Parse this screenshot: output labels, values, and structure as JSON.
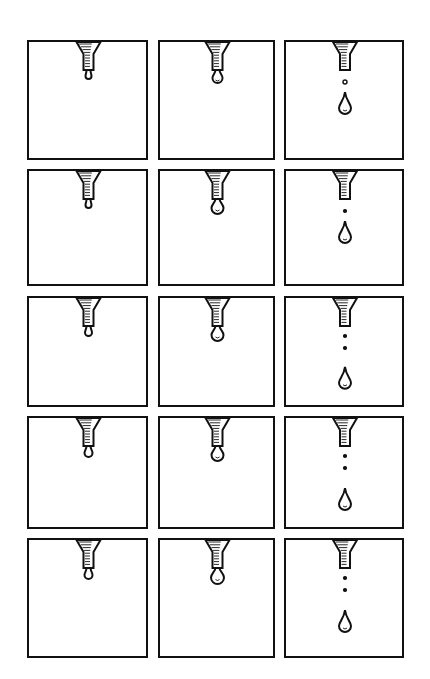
{
  "colors": {
    "ink": "#111111",
    "paper": "#ffffff"
  },
  "grid": {
    "rows": 5,
    "cols": 3
  },
  "columns": [
    {
      "x": 27,
      "w": 121
    },
    {
      "x": 158,
      "w": 117
    },
    {
      "x": 284,
      "w": 120
    }
  ],
  "rows": [
    {
      "y": 40,
      "h": 120
    },
    {
      "y": 169,
      "h": 117
    },
    {
      "y": 296,
      "h": 111
    },
    {
      "y": 416,
      "h": 113
    },
    {
      "y": 538,
      "h": 120
    }
  ],
  "panels": [
    {
      "row": 0,
      "col": 0,
      "stage": "small-drop-forming",
      "drop_r": 3,
      "dots": 0,
      "fall": false
    },
    {
      "row": 0,
      "col": 1,
      "stage": "drop-growing",
      "drop_r": 5,
      "dots": 0,
      "fall": false
    },
    {
      "row": 0,
      "col": 2,
      "stage": "drop-falling",
      "drop_r": 0,
      "dots": 1,
      "fall": true
    },
    {
      "row": 1,
      "col": 0,
      "stage": "small-drop-forming",
      "drop_r": 3,
      "dots": 0,
      "fall": false
    },
    {
      "row": 1,
      "col": 1,
      "stage": "drop-growing",
      "drop_r": 6,
      "dots": 0,
      "fall": false
    },
    {
      "row": 1,
      "col": 2,
      "stage": "drop-falling",
      "drop_r": 0,
      "dots": 1,
      "fall": true
    },
    {
      "row": 2,
      "col": 0,
      "stage": "small-drop-forming",
      "drop_r": 3.5,
      "dots": 0,
      "fall": false
    },
    {
      "row": 2,
      "col": 1,
      "stage": "drop-growing",
      "drop_r": 6,
      "dots": 0,
      "fall": false
    },
    {
      "row": 2,
      "col": 2,
      "stage": "drop-falling",
      "drop_r": 0,
      "dots": 2,
      "fall": true
    },
    {
      "row": 3,
      "col": 0,
      "stage": "small-drop-forming",
      "drop_r": 4,
      "dots": 0,
      "fall": false
    },
    {
      "row": 3,
      "col": 1,
      "stage": "drop-growing",
      "drop_r": 6,
      "dots": 0,
      "fall": false
    },
    {
      "row": 3,
      "col": 2,
      "stage": "drop-falling",
      "drop_r": 0,
      "dots": 2,
      "fall": true
    },
    {
      "row": 4,
      "col": 0,
      "stage": "small-drop-forming",
      "drop_r": 4,
      "dots": 0,
      "fall": false
    },
    {
      "row": 4,
      "col": 1,
      "stage": "drop-growing",
      "drop_r": 6.5,
      "dots": 0,
      "fall": false
    },
    {
      "row": 4,
      "col": 2,
      "stage": "drop-falling",
      "drop_r": 0,
      "dots": 2,
      "fall": true
    }
  ]
}
